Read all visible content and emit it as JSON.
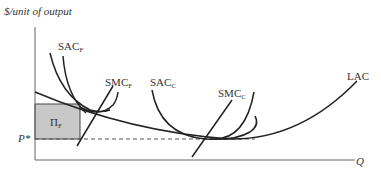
{
  "diagram": {
    "y_axis_label": "$/unit of output",
    "x_axis_label": "Q",
    "price_label": "P*",
    "profit_area_label": "Π",
    "profit_area_sub": "F",
    "curves": [
      {
        "name": "SAC",
        "sub": "F"
      },
      {
        "name": "SMC",
        "sub": "F"
      },
      {
        "name": "SAC",
        "sub": "C"
      },
      {
        "name": "SMC",
        "sub": "C"
      },
      {
        "name": "LAC",
        "sub": ""
      }
    ],
    "colors": {
      "profit_fill": "#c8c8c8",
      "line": "#222222"
    }
  }
}
